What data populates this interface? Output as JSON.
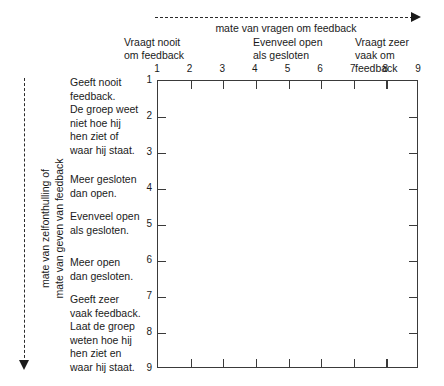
{
  "chart_data": {
    "type": "grid",
    "title": "",
    "xlabel": "mate van vragen om feedback",
    "ylabel_lines": [
      "mate van zelfonthulling of",
      "mate van geven van feedback"
    ],
    "x_axis": {
      "ticks": [
        "1",
        "2",
        "3",
        "4",
        "5",
        "6",
        "7",
        "8",
        "9"
      ],
      "range": [
        1,
        9
      ],
      "direction": "increasing-right",
      "arrow": "dashed-right"
    },
    "y_axis": {
      "ticks": [
        "1",
        "2",
        "3",
        "4",
        "5",
        "6",
        "7",
        "8",
        "9"
      ],
      "range": [
        1,
        9
      ],
      "direction": "increasing-down",
      "arrow": "dashed-down"
    },
    "column_anchors": [
      {
        "position": 1,
        "lines": [
          "Vraagt nooit",
          "om feedback"
        ]
      },
      {
        "position": 5,
        "lines": [
          "Evenveel open",
          "als gesloten"
        ]
      },
      {
        "position": 9,
        "lines": [
          "Vraagt zeer",
          "vaak om",
          "feedback"
        ]
      }
    ],
    "row_anchors": [
      {
        "position": 1,
        "lines": [
          "Geeft nooit",
          "feedback.",
          "De groep weet",
          "niet hoe hij",
          "hen ziet of",
          "waar hij staat."
        ]
      },
      {
        "position": 3.5,
        "lines": [
          "Meer gesloten",
          "dan open."
        ]
      },
      {
        "position": 5,
        "lines": [
          "Evenveel open",
          "als gesloten."
        ]
      },
      {
        "position": 6.3,
        "lines": [
          "Meer open",
          "dan gesloten."
        ]
      },
      {
        "position": 8,
        "lines": [
          "Geeft zeer",
          "vaak feedback.",
          "Laat de groep",
          "weten hoe hij",
          "hen ziet en",
          "waar hij staat."
        ]
      }
    ],
    "grid": "outer-box-only",
    "plotted_points": [],
    "legend": null
  },
  "colors": {
    "background": "#ffffff",
    "line": "#3a3a3a",
    "text": "#1a1a1a",
    "dashed_axis": "#2b2b2b"
  }
}
